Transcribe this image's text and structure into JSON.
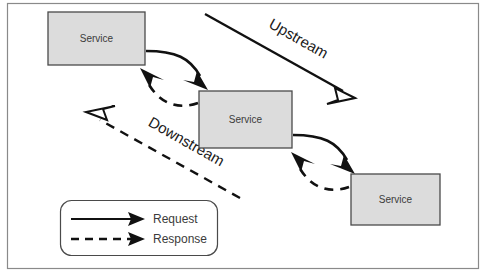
{
  "diagram": {
    "colors": {
      "box_fill": "#dcdcdc",
      "box_stroke": "#4a4a4a",
      "line": "#111111",
      "frame": "#8a8a8a",
      "text": "#3b3b3b",
      "background": "#ffffff"
    },
    "nodes": [
      {
        "id": "service-1",
        "label": "Service",
        "x": 48,
        "y": 12,
        "width": 97,
        "height": 53
      },
      {
        "id": "service-2",
        "label": "Service",
        "x": 199,
        "y": 91,
        "width": 93,
        "height": 57
      },
      {
        "id": "service-3",
        "label": "Service",
        "x": 351,
        "y": 174,
        "width": 89,
        "height": 51
      }
    ],
    "flows": [
      {
        "id": "upstream",
        "label": "Upstream",
        "style": "solid",
        "arrowhead": "hollow",
        "direction": "down-right"
      },
      {
        "id": "downstream",
        "label": "Downstream",
        "style": "dashed",
        "arrowhead": "hollow",
        "direction": "up-left"
      }
    ],
    "connections": [
      {
        "id": "request-1-to-2",
        "from": "service-1",
        "to": "service-2",
        "style": "solid",
        "kind": "Request"
      },
      {
        "id": "response-2-to-1",
        "from": "service-2",
        "to": "service-1",
        "style": "dashed",
        "kind": "Response"
      },
      {
        "id": "request-2-to-3",
        "from": "service-2",
        "to": "service-3",
        "style": "solid",
        "kind": "Request"
      },
      {
        "id": "response-3-to-2",
        "from": "service-3",
        "to": "service-2",
        "style": "dashed",
        "kind": "Response"
      }
    ],
    "legend": {
      "items": [
        {
          "id": "legend-request",
          "label": "Request",
          "style": "solid"
        },
        {
          "id": "legend-response",
          "label": "Response",
          "style": "dashed"
        }
      ]
    }
  }
}
